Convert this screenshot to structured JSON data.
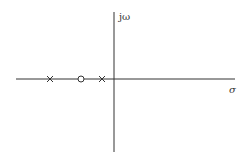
{
  "diagram": {
    "type": "pole-zero plot",
    "axes": {
      "imaginary_label": "jω",
      "real_label": "σ"
    },
    "poles": [
      {
        "marker": "cross",
        "x": 50
      },
      {
        "marker": "cross",
        "x": 102
      }
    ],
    "zeros": [
      {
        "marker": "circle",
        "x": 81
      }
    ],
    "colors": {
      "line": "#333333",
      "background": "#ffffff"
    }
  }
}
